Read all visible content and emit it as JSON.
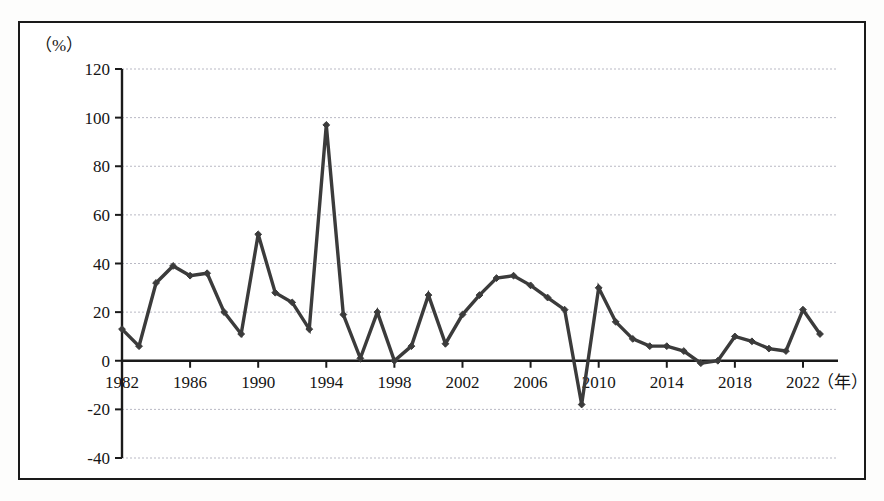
{
  "figure": {
    "unit_label": "（%）",
    "x_unit_label": "（年）",
    "border_color": "#1a1a1a",
    "line_color": "#3b3b3b",
    "grid_color": "#b9b9c4"
  },
  "chart_data": {
    "type": "line",
    "title": "",
    "subtitle": "",
    "xlabel": "（年）",
    "ylabel": "（%）",
    "grid": true,
    "legend": null,
    "xlim": [
      1982,
      2023
    ],
    "ylim": [
      -40,
      120
    ],
    "ytick_labels": [
      "120",
      "100",
      "80",
      "60",
      "40",
      "20",
      "0",
      "-20",
      "-40"
    ],
    "yticks": [
      120,
      100,
      80,
      60,
      40,
      20,
      0,
      -20,
      -40
    ],
    "xtick_labels": [
      "1982",
      "1986",
      "1990",
      "1994",
      "1998",
      "2002",
      "2006",
      "2010",
      "2014",
      "2018",
      "2022"
    ],
    "xticks": [
      1982,
      1986,
      1990,
      1994,
      1998,
      2002,
      2006,
      2010,
      2014,
      2018,
      2022
    ],
    "series": [
      {
        "name": "",
        "marker": "diamond",
        "x": [
          1982,
          1983,
          1984,
          1985,
          1986,
          1987,
          1988,
          1989,
          1990,
          1991,
          1992,
          1993,
          1994,
          1995,
          1996,
          1997,
          1998,
          1999,
          2000,
          2001,
          2002,
          2003,
          2004,
          2005,
          2006,
          2007,
          2008,
          2009,
          2010,
          2011,
          2012,
          2013,
          2014,
          2015,
          2016,
          2017,
          2018,
          2019,
          2020,
          2021,
          2022,
          2023
        ],
        "values": [
          13,
          6,
          32,
          39,
          35,
          36,
          20,
          11,
          52,
          28,
          24,
          13,
          97,
          19,
          1,
          20,
          0,
          6,
          27,
          7,
          19,
          27,
          34,
          35,
          31,
          26,
          21,
          -18,
          30,
          16,
          9,
          6,
          6,
          4,
          -1,
          0,
          10,
          8,
          5,
          4,
          21,
          11
        ]
      }
    ]
  }
}
